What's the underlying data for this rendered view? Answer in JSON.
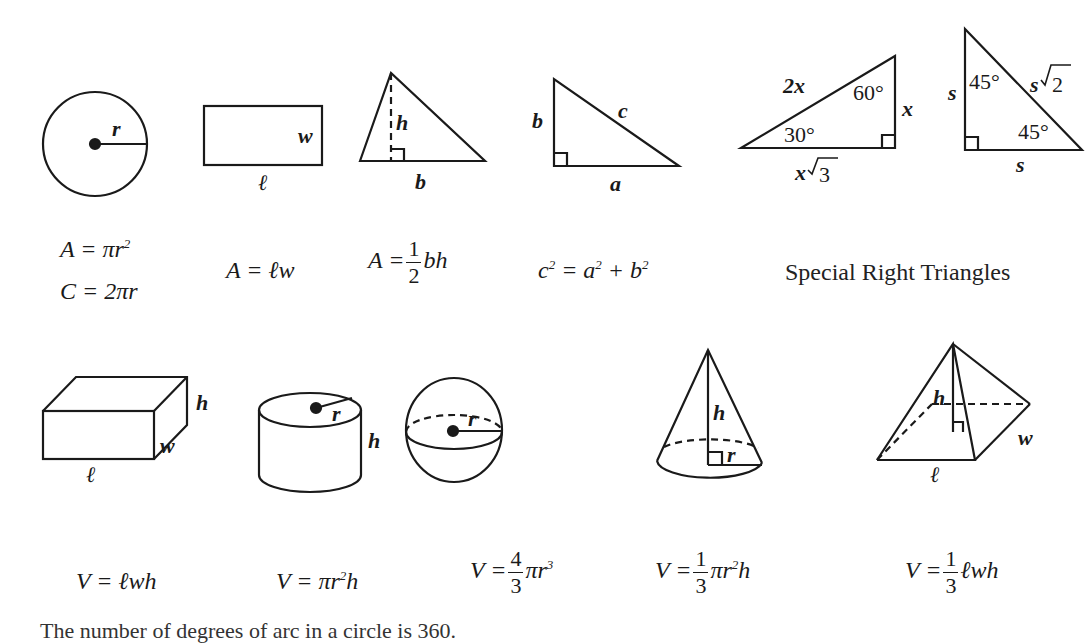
{
  "figures": {
    "circle": {
      "r": "r"
    },
    "rectangle": {
      "w": "w",
      "l": "ℓ"
    },
    "triangle": {
      "h": "h",
      "b": "b"
    },
    "right_triangle": {
      "a": "a",
      "b": "b",
      "c": "c"
    },
    "tri_30_60_90": {
      "hyp": "2x",
      "short": "x",
      "long_prefix": "x",
      "long_root": "3",
      "angle_small": "30°",
      "angle_large": "60°"
    },
    "tri_45_45_90": {
      "leg_left": "s",
      "leg_bottom": "s",
      "hyp_prefix": "s",
      "hyp_root": "2",
      "angle_top": "45°",
      "angle_bottom": "45°"
    },
    "box": {
      "h": "h",
      "w": "w",
      "l": "ℓ"
    },
    "cylinder": {
      "r": "r",
      "h": "h"
    },
    "sphere": {
      "r": "r"
    },
    "cone": {
      "h": "h",
      "r": "r"
    },
    "pyramid": {
      "h": "h",
      "w": "w",
      "l": "ℓ"
    }
  },
  "formulas": {
    "circle_area": {
      "lhs": "A = πr",
      "exp": "2"
    },
    "circle_circ": "C = 2πr",
    "rect_area": "A = ℓw",
    "tri_area": {
      "lhs": "A =",
      "num": "1",
      "den": "2",
      "rhs": "bh"
    },
    "pythag": {
      "c": "c",
      "eq": " = a",
      "plus": " + b",
      "exp": "2"
    },
    "special_title": "Special Right Triangles",
    "box_vol": "V = ℓwh",
    "cyl_vol": {
      "lhs": "V = πr",
      "exp": "2",
      "rhs": "h"
    },
    "sphere_vol": {
      "lhs": "V =",
      "num": "4",
      "den": "3",
      "rhs": "πr",
      "exp": "3"
    },
    "cone_vol": {
      "lhs": "V =",
      "num": "1",
      "den": "3",
      "rhs": "πr",
      "exp": "2",
      "tail": "h"
    },
    "pyr_vol": {
      "lhs": "V =",
      "num": "1",
      "den": "3",
      "rhs": "ℓwh"
    }
  },
  "footer_text": "The number of degrees of arc in a circle is 360."
}
